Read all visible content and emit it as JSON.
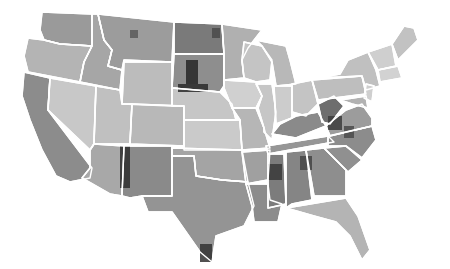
{
  "map": {
    "type": "choropleth",
    "region": "Contiguous United States (counties)",
    "palette": "grayscale",
    "border_color": "#ffffff",
    "background": "#ffffff",
    "states": [
      {
        "id": "WA",
        "fill": "#9a9a9a",
        "points": "42,12 92,14 92,46 60,44 44,40 40,30"
      },
      {
        "id": "OR",
        "fill": "#b4b4b4",
        "points": "28,38 44,40 60,44 92,46 84,62 80,82 28,72 24,56"
      },
      {
        "id": "CA",
        "fill": "#8c8c8c",
        "points": "24,72 50,78 48,110 92,168 90,178 70,182 56,176 42,150 30,120 22,96"
      },
      {
        "id": "ID",
        "fill": "#a6a6a6",
        "points": "92,14 98,14 104,40 112,50 108,66 122,70 120,90 80,82 84,62 92,46"
      },
      {
        "id": "NV",
        "fill": "#c8c8c8",
        "points": "50,78 96,86 94,144 90,150 48,110"
      },
      {
        "id": "MT",
        "fill": "#9c9c9c",
        "points": "98,14 174,22 172,62 124,60 122,70 108,66 112,50 104,40"
      },
      {
        "id": "WY",
        "fill": "#bcbcbc",
        "points": "124,62 172,62 172,106 122,104"
      },
      {
        "id": "UT",
        "fill": "#c0c0c0",
        "points": "96,86 120,90 122,104 132,104 130,144 94,144"
      },
      {
        "id": "AZ",
        "fill": "#a8a8a8",
        "points": "94,144 124,146 122,196 110,194 82,178 90,168 90,150"
      },
      {
        "id": "CO",
        "fill": "#b8b8b8",
        "points": "132,104 184,106 184,146 130,144"
      },
      {
        "id": "NM",
        "fill": "#8a8a8a",
        "points": "124,146 172,146 172,196 142,196 130,198 122,196"
      },
      {
        "id": "ND",
        "fill": "#7a7a7a",
        "points": "174,22 222,24 224,54 174,54"
      },
      {
        "id": "SD",
        "fill": "#8e8e8e",
        "points": "174,54 224,54 224,86 220,92 172,88"
      },
      {
        "id": "NE",
        "fill": "#c6c6c6",
        "points": "172,88 220,92 232,104 236,120 184,120 184,106 172,106"
      },
      {
        "id": "KS",
        "fill": "#cacaca",
        "points": "184,120 240,120 242,150 184,150"
      },
      {
        "id": "OK",
        "fill": "#a4a4a4",
        "points": "172,148 242,150 248,182 222,180 196,176 194,156 172,156"
      },
      {
        "id": "TX",
        "fill": "#949494",
        "points": "172,156 194,156 196,176 222,180 248,182 254,206 244,226 216,236 212,262 200,252 186,232 172,212 148,212 142,196 172,196"
      },
      {
        "id": "MN",
        "fill": "#b0b0b0",
        "points": "222,24 262,30 248,48 242,60 244,78 224,80 224,54"
      },
      {
        "id": "IA",
        "fill": "#d0d0d0",
        "points": "224,80 256,82 262,96 256,108 232,108 224,88"
      },
      {
        "id": "MO",
        "fill": "#b6b6b6",
        "points": "232,108 256,108 264,128 270,148 242,150 240,120"
      },
      {
        "id": "AR",
        "fill": "#a0a0a0",
        "points": "242,152 270,150 268,180 246,184"
      },
      {
        "id": "LA",
        "fill": "#8c8c8c",
        "points": "246,184 268,184 270,200 282,204 278,222 254,222 252,206"
      },
      {
        "id": "WI",
        "fill": "#c4c4c4",
        "points": "244,42 262,46 272,60 270,80 256,82 244,78 242,60"
      },
      {
        "id": "IL",
        "fill": "#c6c6c6",
        "points": "256,84 272,84 276,112 272,140 264,132 264,128 258,108 262,96"
      },
      {
        "id": "MI",
        "fill": "#b8b8b8",
        "points": "256,40 286,46 290,60 296,84 276,86 272,62 262,46"
      },
      {
        "id": "IN",
        "fill": "#cccccc",
        "points": "274,86 292,86 292,118 276,124"
      },
      {
        "id": "OH",
        "fill": "#c4c4c4",
        "points": "292,84 312,80 318,104 306,116 292,112"
      },
      {
        "id": "KY",
        "fill": "#8a8a8a",
        "points": "272,134 280,124 296,116 318,112 326,126 296,138"
      },
      {
        "id": "TN",
        "fill": "#969696",
        "points": "266,146 328,136 334,142 268,154"
      },
      {
        "id": "MS",
        "fill": "#7c7c7c",
        "points": "268,154 284,154 286,204 268,208"
      },
      {
        "id": "AL",
        "fill": "#858585",
        "points": "286,152 306,150 312,200 292,204 286,208"
      },
      {
        "id": "GA",
        "fill": "#8e8e8e",
        "points": "306,150 324,148 346,170 346,196 314,196"
      },
      {
        "id": "FL",
        "fill": "#b4b4b4",
        "points": "286,208 346,198 358,216 370,250 362,260 350,236 336,222 314,216"
      },
      {
        "id": "SC",
        "fill": "#909090",
        "points": "324,148 346,146 362,160 348,172"
      },
      {
        "id": "NC",
        "fill": "#8c8c8c",
        "points": "328,136 372,126 376,140 362,158 346,146 328,146"
      },
      {
        "id": "VA",
        "fill": "#9c9c9c",
        "points": "326,126 346,110 362,104 372,118 372,126 330,136"
      },
      {
        "id": "WV",
        "fill": "#6e6e6e",
        "points": "318,104 334,96 344,106 330,124 322,122"
      },
      {
        "id": "PA",
        "fill": "#bebebe",
        "points": "312,80 362,76 366,94 318,100"
      },
      {
        "id": "NY",
        "fill": "#c0c0c0",
        "points": "318,78 340,74 348,60 368,52 376,70 380,86 366,90 362,76"
      },
      {
        "id": "NJ",
        "fill": "#cfcfcf",
        "points": "366,84 374,86 372,102 364,98"
      },
      {
        "id": "MD",
        "fill": "#b2b2b2",
        "points": "340,100 366,96 368,108 352,104"
      },
      {
        "id": "VT_NH",
        "fill": "#cfcfcf",
        "points": "368,52 392,44 396,66 378,70"
      },
      {
        "id": "MA_CT_RI",
        "fill": "#d2d2d2",
        "points": "378,70 398,66 402,78 380,82"
      },
      {
        "id": "ME",
        "fill": "#c2c2c2",
        "points": "392,44 404,26 414,28 418,40 398,60"
      }
    ],
    "dark_spots": [
      {
        "x": 186,
        "y": 60,
        "w": 12,
        "h": 24,
        "fill": "#262626"
      },
      {
        "x": 178,
        "y": 84,
        "w": 30,
        "h": 8,
        "fill": "#2a2a2a"
      },
      {
        "x": 120,
        "y": 146,
        "w": 10,
        "h": 42,
        "fill": "#2e2e2e"
      },
      {
        "x": 200,
        "y": 244,
        "w": 12,
        "h": 18,
        "fill": "#333333"
      },
      {
        "x": 268,
        "y": 164,
        "w": 14,
        "h": 16,
        "fill": "#3a3a3a"
      },
      {
        "x": 300,
        "y": 156,
        "w": 12,
        "h": 14,
        "fill": "#444444"
      },
      {
        "x": 328,
        "y": 116,
        "w": 14,
        "h": 14,
        "fill": "#3c3c3c"
      },
      {
        "x": 344,
        "y": 126,
        "w": 10,
        "h": 12,
        "fill": "#4a4a4a"
      },
      {
        "x": 212,
        "y": 28,
        "w": 8,
        "h": 10,
        "fill": "#4a4a4a"
      },
      {
        "x": 130,
        "y": 30,
        "w": 8,
        "h": 8,
        "fill": "#5a5a5a"
      }
    ]
  }
}
